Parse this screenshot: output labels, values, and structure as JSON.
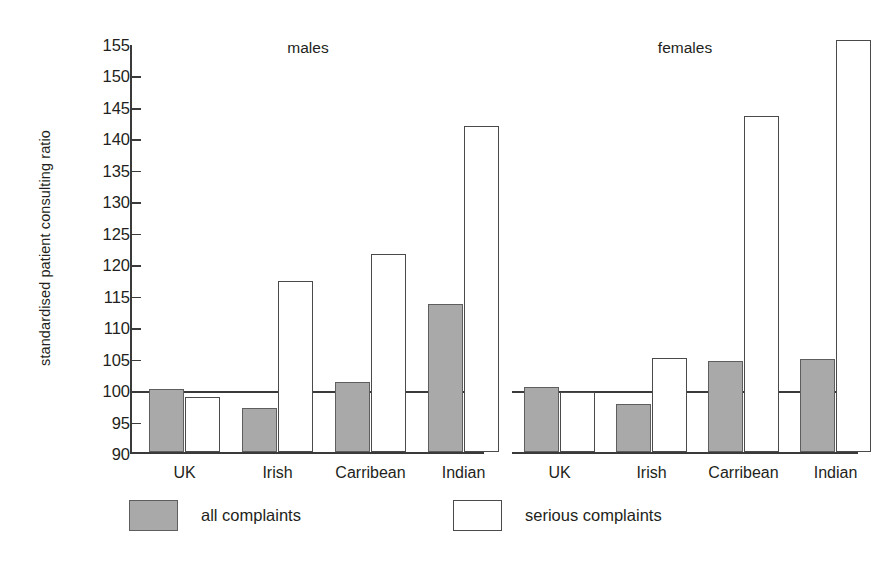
{
  "chart_data": {
    "type": "bar",
    "title": "",
    "xlabel": "",
    "ylabel": "standardised patient consulting ratio",
    "ylim": [
      90,
      155
    ],
    "ytick_step": 5,
    "yticks": [
      90,
      95,
      100,
      105,
      110,
      115,
      120,
      125,
      130,
      135,
      140,
      145,
      150,
      155
    ],
    "grid": false,
    "reference_line": 100,
    "legend_position": "bottom",
    "categories": [
      "UK",
      "Irish",
      "Carribean",
      "Indian"
    ],
    "panels": [
      {
        "name": "males",
        "label": "males",
        "series": [
          {
            "name": "all complaints",
            "values": [
              100.0,
              97.0,
              101.2,
              113.6
            ]
          },
          {
            "name": "serious complaints",
            "values": [
              98.8,
              117.2,
              121.4,
              141.8
            ]
          }
        ]
      },
      {
        "name": "females",
        "label": "females",
        "series": [
          {
            "name": "all complaints",
            "values": [
              100.3,
              97.7,
              104.4,
              104.8
            ]
          },
          {
            "name": "serious complaints",
            "values": [
              99.5,
              105.0,
              143.4,
              155.4
            ]
          }
        ]
      }
    ],
    "legend": [
      {
        "key": "all",
        "label": "all complaints",
        "color": "#a9a9a9",
        "style": "filled-grey"
      },
      {
        "key": "serious",
        "label": "serious complaints",
        "color": "#ffffff",
        "style": "outline-white"
      }
    ]
  },
  "colors": {
    "all_complaints_fill": "#a9a9a9",
    "all_complaints_border": "#5e5e5e",
    "serious_complaints_fill": "#ffffff",
    "serious_complaints_border": "#4a4a4a",
    "axis": "#3a3a3a",
    "text": "#231f20",
    "background": "#ffffff"
  }
}
